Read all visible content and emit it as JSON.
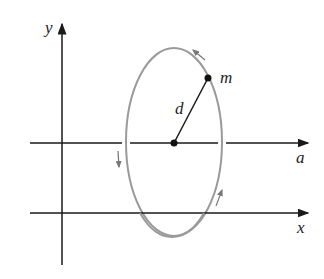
{
  "diagram": {
    "type": "rotation about axis a, parallel to x-axis",
    "labels": {
      "y_axis": "y",
      "x_axis": "x",
      "a_axis": "a",
      "mass": "m",
      "distance": "d"
    },
    "colors": {
      "axes": "#1a1a1a",
      "orbit": "#9a9a9a",
      "rotation_arrows": "#777777",
      "background": "#ffffff"
    },
    "elements": {
      "y_axis": {
        "x": 62,
        "y_top": 22,
        "y_bottom": 265
      },
      "a_axis": {
        "y": 143,
        "x_start": 30,
        "x_end": 308
      },
      "x_axis": {
        "y": 213,
        "x_start": 30,
        "x_end": 308
      },
      "orbit_ellipse": {
        "cx": 174,
        "cy": 142,
        "rx": 48,
        "ry": 94
      },
      "axis_point": {
        "x": 174,
        "y": 143
      },
      "mass_point": {
        "x": 208,
        "y": 78
      }
    }
  }
}
